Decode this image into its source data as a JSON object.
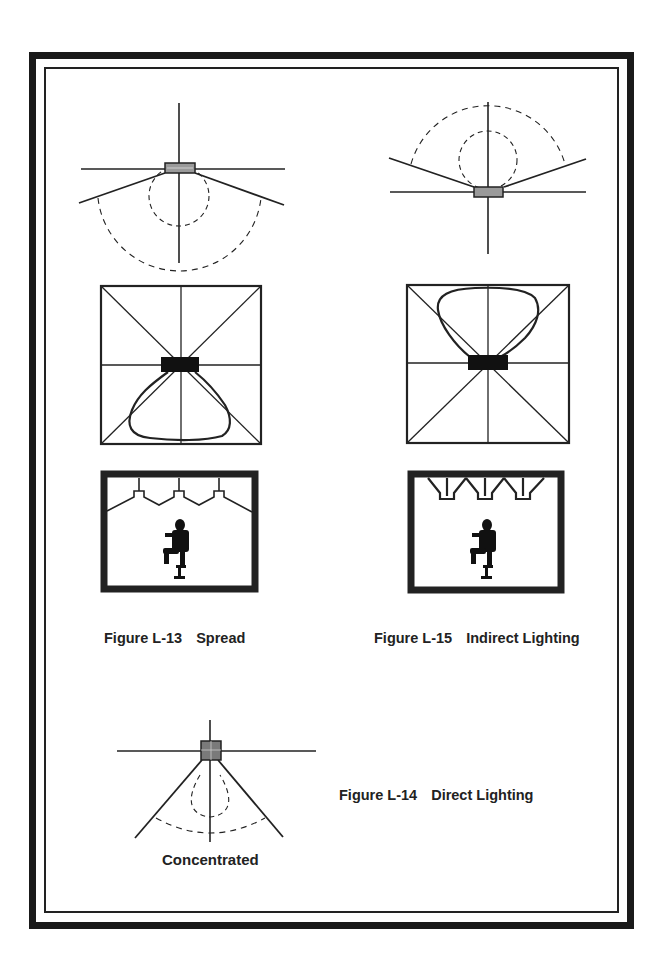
{
  "figures": {
    "l13": {
      "number": "Figure L-13",
      "title": "Spread"
    },
    "l15": {
      "number": "Figure L-15",
      "title": "Indirect Lighting"
    },
    "l14": {
      "number": "Figure L-14",
      "title": "Direct Lighting",
      "sublabel": "Concentrated"
    }
  },
  "colors": {
    "line": "#222222",
    "fill_dark": "#111111",
    "fixture_fill": "#9a9a9a"
  }
}
